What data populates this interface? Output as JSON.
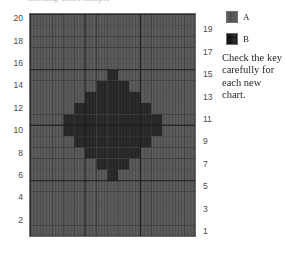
{
  "caption_sliver": "knitting chart sample",
  "legend": {
    "title": "",
    "entries": [
      {
        "label": "A",
        "color": "#5c5c5c",
        "pattern": "solid",
        "swatch_name": "legend-swatch-a"
      },
      {
        "label": "B",
        "color": "#2b2b2b",
        "pattern": "textured",
        "swatch_name": "legend-swatch-b"
      }
    ],
    "note": "Check the key carefully for each new chart."
  },
  "axes": {
    "left_ticks": [
      "20",
      "18",
      "16",
      "14",
      "12",
      "10",
      "8",
      "6",
      "4",
      "2"
    ],
    "right_ticks": [
      "19",
      "17",
      "15",
      "13",
      "11",
      "9",
      "7",
      "5",
      "3",
      "1"
    ]
  },
  "chart_data": {
    "type": "heatmap",
    "title": "",
    "subtitle": "",
    "xlabel": "",
    "ylabel": "",
    "grid": true,
    "legend_position": "right",
    "columns": 15,
    "rows": 20,
    "row_labels_left": [
      "20",
      "",
      "18",
      "",
      "16",
      "",
      "14",
      "",
      "12",
      "",
      "10",
      "",
      "8",
      "",
      "6",
      "",
      "4",
      "",
      "2",
      ""
    ],
    "row_labels_right": [
      "",
      "19",
      "",
      "17",
      "",
      "15",
      "",
      "13",
      "",
      "11",
      "",
      "9",
      "",
      "7",
      "",
      "5",
      "",
      "3",
      "",
      "1"
    ],
    "colors": {
      "A": "#5c5c5c",
      "B": "#2b2b2b"
    },
    "gridline_color": "#3f3f3f",
    "heavy_gridline_color": "#1d1d1d",
    "heavy_every": 5,
    "legend_keys": [
      "A",
      "B"
    ],
    "cell_values": [
      [
        "A",
        "A",
        "A",
        "A",
        "A",
        "A",
        "A",
        "A",
        "A",
        "A",
        "A",
        "A",
        "A",
        "A",
        "A"
      ],
      [
        "A",
        "A",
        "A",
        "A",
        "A",
        "A",
        "A",
        "A",
        "A",
        "A",
        "A",
        "A",
        "A",
        "A",
        "A"
      ],
      [
        "A",
        "A",
        "A",
        "A",
        "A",
        "A",
        "A",
        "A",
        "A",
        "A",
        "A",
        "A",
        "A",
        "A",
        "A"
      ],
      [
        "A",
        "A",
        "A",
        "A",
        "A",
        "A",
        "A",
        "A",
        "A",
        "A",
        "A",
        "A",
        "A",
        "A",
        "A"
      ],
      [
        "A",
        "A",
        "A",
        "A",
        "A",
        "A",
        "A",
        "A",
        "A",
        "A",
        "A",
        "A",
        "A",
        "A",
        "A"
      ],
      [
        "A",
        "A",
        "A",
        "A",
        "A",
        "A",
        "A",
        "B",
        "A",
        "A",
        "A",
        "A",
        "A",
        "A",
        "A"
      ],
      [
        "A",
        "A",
        "A",
        "A",
        "A",
        "A",
        "B",
        "B",
        "B",
        "A",
        "A",
        "A",
        "A",
        "A",
        "A"
      ],
      [
        "A",
        "A",
        "A",
        "A",
        "A",
        "B",
        "B",
        "B",
        "B",
        "B",
        "A",
        "A",
        "A",
        "A",
        "A"
      ],
      [
        "A",
        "A",
        "A",
        "A",
        "B",
        "B",
        "B",
        "B",
        "B",
        "B",
        "B",
        "A",
        "A",
        "A",
        "A"
      ],
      [
        "A",
        "A",
        "A",
        "B",
        "B",
        "B",
        "B",
        "B",
        "B",
        "B",
        "B",
        "B",
        "A",
        "A",
        "A"
      ],
      [
        "A",
        "A",
        "A",
        "B",
        "B",
        "B",
        "B",
        "B",
        "B",
        "B",
        "B",
        "B",
        "A",
        "A",
        "A"
      ],
      [
        "A",
        "A",
        "A",
        "A",
        "B",
        "B",
        "B",
        "B",
        "B",
        "B",
        "B",
        "A",
        "A",
        "A",
        "A"
      ],
      [
        "A",
        "A",
        "A",
        "A",
        "A",
        "B",
        "B",
        "B",
        "B",
        "B",
        "A",
        "A",
        "A",
        "A",
        "A"
      ],
      [
        "A",
        "A",
        "A",
        "A",
        "A",
        "A",
        "B",
        "B",
        "B",
        "A",
        "A",
        "A",
        "A",
        "A",
        "A"
      ],
      [
        "A",
        "A",
        "A",
        "A",
        "A",
        "A",
        "A",
        "B",
        "A",
        "A",
        "A",
        "A",
        "A",
        "A",
        "A"
      ],
      [
        "A",
        "A",
        "A",
        "A",
        "A",
        "A",
        "A",
        "A",
        "A",
        "A",
        "A",
        "A",
        "A",
        "A",
        "A"
      ],
      [
        "A",
        "A",
        "A",
        "A",
        "A",
        "A",
        "A",
        "A",
        "A",
        "A",
        "A",
        "A",
        "A",
        "A",
        "A"
      ],
      [
        "A",
        "A",
        "A",
        "A",
        "A",
        "A",
        "A",
        "A",
        "A",
        "A",
        "A",
        "A",
        "A",
        "A",
        "A"
      ],
      [
        "A",
        "A",
        "A",
        "A",
        "A",
        "A",
        "A",
        "A",
        "A",
        "A",
        "A",
        "A",
        "A",
        "A",
        "A"
      ],
      [
        "A",
        "A",
        "A",
        "A",
        "A",
        "A",
        "A",
        "A",
        "A",
        "A",
        "A",
        "A",
        "A",
        "A",
        "A"
      ]
    ]
  }
}
